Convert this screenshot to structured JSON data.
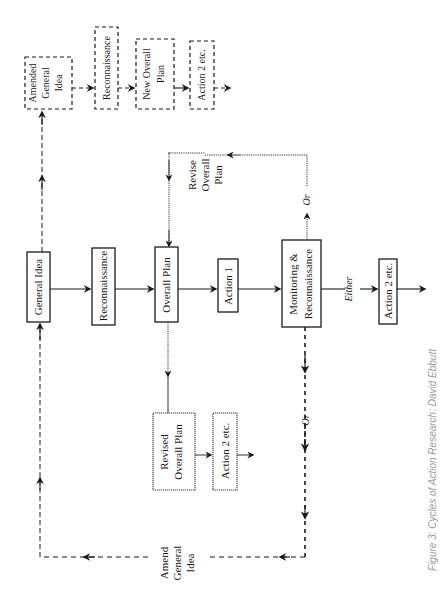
{
  "diagram": {
    "title": "Cycles of Action Research",
    "orientation": "rotated 90° counter-clockwise (text reads bottom-to-top)",
    "main_cycle": {
      "general_idea": "General Idea",
      "reconnaissance": "Reconnaissance",
      "overall_plan": "Overall Plan",
      "action_1": "Action 1",
      "monitoring_line1": "Monitoring  &",
      "monitoring_line2": "Reconnaissance",
      "either_label": "Either",
      "action_2": "Action 2 etc."
    },
    "revise_branch": {
      "revise_line1": "Revise",
      "revise_line2": "Overall",
      "revise_line3": "Plan",
      "or_label": "Or",
      "revised_plan_line1": "Revised",
      "revised_plan_line2": "Overall  Plan",
      "action_2": "Action 2 etc."
    },
    "amend_branch": {
      "or_label": "Or",
      "amend_line1": "Amend",
      "amend_line2": "General",
      "amend_line3": "Idea",
      "amended_line1": "Amended",
      "amended_line2": "General",
      "amended_line3": "Idea",
      "reconnaissance": "Reconnaissance",
      "new_plan_line1": "New Overall",
      "new_plan_line2": "Plan",
      "action_2": "Action 2 etc."
    },
    "caption": "Figure 3:  Cycles of Action Research: David Ebbutt"
  },
  "colors": {
    "ink": "#1a1a1a",
    "dotted": "#333333",
    "caption": "#9a9a9a",
    "background": "#ffffff"
  }
}
